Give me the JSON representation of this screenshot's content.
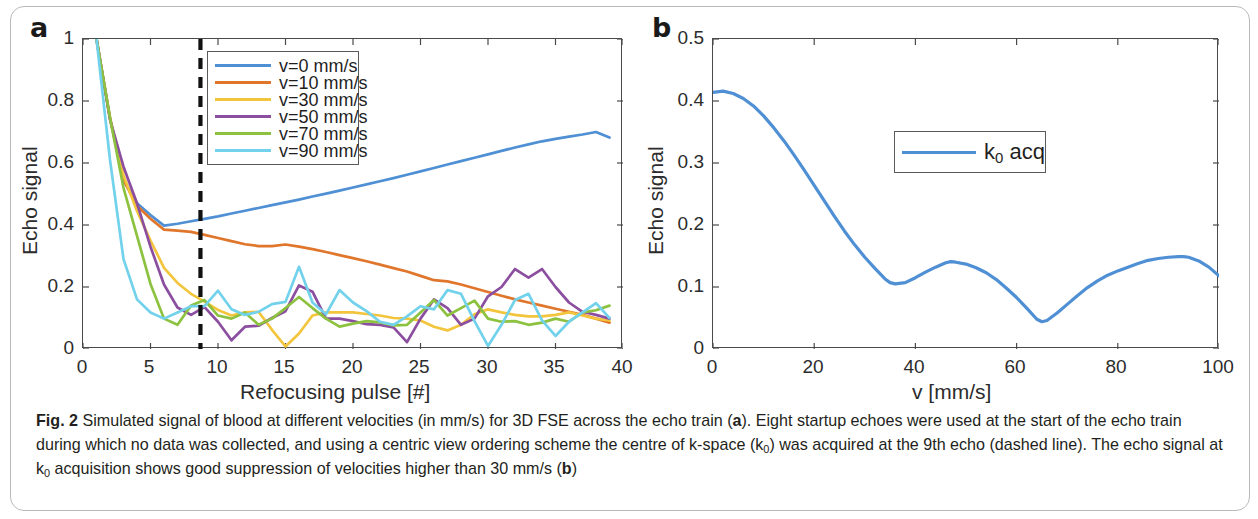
{
  "figure": {
    "caption_prefix": "Fig. 2",
    "caption_text": " Simulated signal of blood at different velocities (in mm/s) for 3D FSE across the echo train (a). Eight startup echoes were used at the start of the echo train during which no data was collected, and using a centric view ordering scheme the centre of k-space (k0) was acquired at the 9th echo (dashed line). The echo signal at k0 acquisition shows good suppression of velocities higher than 30 mm/s (b)"
  },
  "panels": {
    "a": {
      "label": "a",
      "xlabel": "Refocusing pulse [#]",
      "ylabel": "Echo signal",
      "xticks": [
        "0",
        "5",
        "10",
        "15",
        "20",
        "25",
        "30",
        "35",
        "40"
      ],
      "yticks": [
        "0",
        "0.2",
        "0.4",
        "0.6",
        "0.8",
        "1"
      ],
      "annotation": {
        "name": "k0-acquisition-dashed-line",
        "x": 8.7
      }
    },
    "b": {
      "label": "b",
      "xlabel": "v [mm/s]",
      "ylabel": "Echo signal",
      "xticks": [
        "0",
        "20",
        "40",
        "60",
        "80",
        "100"
      ],
      "yticks": [
        "0",
        "0.1",
        "0.2",
        "0.3",
        "0.4",
        "0.5"
      ],
      "legend": {
        "label_main": "k",
        "label_sub": "0",
        "label_tail": " acq"
      }
    }
  },
  "colors": {
    "series_v0": "#4f8fd4",
    "series_v10": "#e0762c",
    "series_v30": "#f2c53d",
    "series_v50": "#8c4fa0",
    "series_v70": "#8cc23f",
    "series_v90": "#72d2eb",
    "dashed_line": "#111111",
    "axis": "#4a4a4a",
    "frame": "#b9b9b9"
  },
  "chart_data": [
    {
      "type": "line",
      "panel": "a",
      "title": "",
      "xlabel": "Refocusing pulse [#]",
      "ylabel": "Echo signal",
      "xlim": [
        0,
        40
      ],
      "ylim": [
        0,
        1
      ],
      "xticks": [
        0,
        5,
        10,
        15,
        20,
        25,
        30,
        35,
        40
      ],
      "yticks": [
        0,
        0.2,
        0.4,
        0.6,
        0.8,
        1
      ],
      "grid": false,
      "legend_position": "upper-center-left",
      "annotations": [
        {
          "type": "vline",
          "x": 8.7,
          "style": "dashed",
          "color": "#111111",
          "note": "k0 acquired at 9th echo"
        }
      ],
      "x": [
        1,
        2,
        3,
        4,
        5,
        6,
        7,
        8,
        9,
        10,
        11,
        12,
        13,
        14,
        15,
        16,
        17,
        18,
        19,
        20,
        21,
        22,
        23,
        24,
        25,
        26,
        27,
        28,
        29,
        30,
        31,
        32,
        33,
        34,
        35,
        36,
        37,
        38,
        39
      ],
      "series": [
        {
          "name": "v=0 mm/s",
          "color": "#4f8fd4",
          "values": [
            1.0,
            0.745,
            0.545,
            0.47,
            0.432,
            0.398,
            0.404,
            0.412,
            0.42,
            0.428,
            0.437,
            0.446,
            0.455,
            0.464,
            0.473,
            0.482,
            0.492,
            0.501,
            0.511,
            0.521,
            0.531,
            0.541,
            0.551,
            0.562,
            0.573,
            0.584,
            0.595,
            0.606,
            0.617,
            0.628,
            0.639,
            0.65,
            0.66,
            0.67,
            0.678,
            0.685,
            0.692,
            0.7,
            0.682
          ]
        },
        {
          "name": "v=10 mm/s",
          "color": "#e0762c",
          "values": [
            1.0,
            0.745,
            0.545,
            0.462,
            0.42,
            0.385,
            0.382,
            0.378,
            0.368,
            0.358,
            0.348,
            0.338,
            0.332,
            0.332,
            0.337,
            0.33,
            0.322,
            0.313,
            0.303,
            0.293,
            0.283,
            0.272,
            0.261,
            0.25,
            0.236,
            0.222,
            0.218,
            0.208,
            0.196,
            0.184,
            0.172,
            0.16,
            0.15,
            0.14,
            0.13,
            0.12,
            0.11,
            0.098,
            0.085
          ]
        },
        {
          "name": "v=30 mm/s",
          "color": "#f2c53d",
          "values": [
            1.0,
            0.745,
            0.56,
            0.445,
            0.35,
            0.262,
            0.213,
            0.178,
            0.153,
            0.126,
            0.108,
            0.118,
            0.12,
            0.062,
            0.008,
            0.05,
            0.108,
            0.118,
            0.118,
            0.118,
            0.113,
            0.108,
            0.1,
            0.098,
            0.092,
            0.072,
            0.06,
            0.078,
            0.112,
            0.128,
            0.118,
            0.11,
            0.105,
            0.105,
            0.11,
            0.118,
            0.108,
            0.098,
            0.092
          ]
        },
        {
          "name": "v=50 mm/s",
          "color": "#8c4fa0",
          "values": [
            1.0,
            0.74,
            0.588,
            0.47,
            0.33,
            0.208,
            0.134,
            0.11,
            0.135,
            0.088,
            0.028,
            0.072,
            0.075,
            0.1,
            0.122,
            0.205,
            0.185,
            0.098,
            0.098,
            0.09,
            0.08,
            0.078,
            0.07,
            0.022,
            0.098,
            0.16,
            0.132,
            0.078,
            0.098,
            0.17,
            0.2,
            0.258,
            0.23,
            0.258,
            0.2,
            0.15,
            0.12,
            0.11,
            0.098
          ]
        },
        {
          "name": "v=70 mm/s",
          "color": "#8cc23f",
          "values": [
            1.0,
            0.745,
            0.52,
            0.365,
            0.21,
            0.098,
            0.078,
            0.14,
            0.158,
            0.108,
            0.098,
            0.118,
            0.078,
            0.098,
            0.132,
            0.168,
            0.132,
            0.098,
            0.072,
            0.082,
            0.09,
            0.086,
            0.076,
            0.078,
            0.118,
            0.158,
            0.108,
            0.132,
            0.156,
            0.098,
            0.088,
            0.09,
            0.078,
            0.085,
            0.098,
            0.088,
            0.118,
            0.125,
            0.14
          ]
        },
        {
          "name": "v=90 mm/s",
          "color": "#72d2eb",
          "values": [
            1.0,
            0.61,
            0.29,
            0.16,
            0.118,
            0.098,
            0.118,
            0.138,
            0.138,
            0.188,
            0.128,
            0.11,
            0.12,
            0.145,
            0.152,
            0.265,
            0.15,
            0.112,
            0.19,
            0.15,
            0.122,
            0.088,
            0.078,
            0.105,
            0.138,
            0.128,
            0.19,
            0.178,
            0.09,
            0.01,
            0.078,
            0.158,
            0.178,
            0.092,
            0.042,
            0.088,
            0.118,
            0.148,
            0.1
          ]
        }
      ]
    },
    {
      "type": "line",
      "panel": "b",
      "title": "",
      "xlabel": "v [mm/s]",
      "ylabel": "Echo signal",
      "xlim": [
        0,
        100
      ],
      "ylim": [
        0,
        0.5
      ],
      "xticks": [
        0,
        20,
        40,
        60,
        80,
        100
      ],
      "yticks": [
        0,
        0.1,
        0.2,
        0.3,
        0.4,
        0.5
      ],
      "grid": false,
      "legend_position": "upper-right-of-centre",
      "series": [
        {
          "name": "k0 acq",
          "color": "#4f8fd4",
          "x": [
            0,
            2,
            4,
            6,
            8,
            10,
            12,
            14,
            16,
            18,
            20,
            22,
            24,
            26,
            28,
            30,
            32,
            34,
            35,
            36,
            38,
            40,
            42,
            44,
            46,
            47,
            48,
            50,
            52,
            54,
            56,
            58,
            60,
            62,
            64,
            65,
            66,
            68,
            70,
            72,
            74,
            76,
            78,
            80,
            82,
            84,
            86,
            88,
            90,
            92,
            93,
            94,
            96,
            98,
            100
          ],
          "values": [
            0.414,
            0.416,
            0.412,
            0.404,
            0.392,
            0.376,
            0.357,
            0.336,
            0.313,
            0.289,
            0.264,
            0.239,
            0.214,
            0.19,
            0.168,
            0.148,
            0.13,
            0.113,
            0.107,
            0.105,
            0.107,
            0.115,
            0.124,
            0.132,
            0.139,
            0.141,
            0.14,
            0.137,
            0.131,
            0.123,
            0.112,
            0.098,
            0.083,
            0.066,
            0.048,
            0.044,
            0.046,
            0.058,
            0.072,
            0.086,
            0.099,
            0.11,
            0.119,
            0.126,
            0.132,
            0.138,
            0.143,
            0.146,
            0.148,
            0.149,
            0.149,
            0.148,
            0.142,
            0.132,
            0.118
          ]
        }
      ]
    }
  ]
}
